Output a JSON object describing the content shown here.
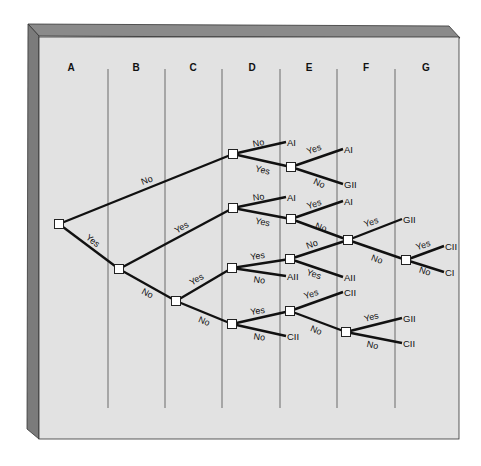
{
  "diagram": {
    "type": "decision-tree",
    "columns": [
      {
        "label": "A",
        "x": 71
      },
      {
        "label": "B",
        "x": 136
      },
      {
        "label": "C",
        "x": 193
      },
      {
        "label": "D",
        "x": 252
      },
      {
        "label": "E",
        "x": 309
      },
      {
        "label": "F",
        "x": 366
      },
      {
        "label": "G",
        "x": 426
      }
    ],
    "dividers_x": [
      108,
      165,
      222,
      280,
      337,
      395
    ],
    "colors": {
      "panel_face": "#e2e2e2",
      "panel_edge_top": "#8a8a8a",
      "panel_edge_left": "#7b7b7b",
      "lines": "#111111",
      "dividers": "#6a6a6a",
      "node_fill": "#ffffff"
    },
    "nodes": [
      {
        "id": "A",
        "x": 59,
        "y": 224
      },
      {
        "id": "B",
        "x": 119,
        "y": 269
      },
      {
        "id": "C",
        "x": 176,
        "y": 301
      },
      {
        "id": "D1",
        "x": 233,
        "y": 154
      },
      {
        "id": "D2",
        "x": 233,
        "y": 208
      },
      {
        "id": "D3",
        "x": 232,
        "y": 268
      },
      {
        "id": "D4",
        "x": 232,
        "y": 324
      },
      {
        "id": "E1",
        "x": 291,
        "y": 167
      },
      {
        "id": "E2",
        "x": 291,
        "y": 219
      },
      {
        "id": "E3",
        "x": 290,
        "y": 259
      },
      {
        "id": "E4",
        "x": 290,
        "y": 311
      },
      {
        "id": "F1",
        "x": 348,
        "y": 240
      },
      {
        "id": "F2",
        "x": 346,
        "y": 332
      },
      {
        "id": "G1",
        "x": 406,
        "y": 260
      }
    ],
    "edges": [
      {
        "from": "A",
        "to": "D1",
        "label": "No",
        "lx": 148,
        "ly": 183,
        "rot": -21
      },
      {
        "from": "A",
        "to": "B",
        "label": "Yes",
        "lx": 91,
        "ly": 243,
        "rot": 38
      },
      {
        "from": "B",
        "to": "D2",
        "label": "Yes",
        "lx": 183,
        "ly": 230,
        "rot": -30
      },
      {
        "from": "B",
        "to": "C",
        "label": "No",
        "lx": 146,
        "ly": 296,
        "rot": 28
      },
      {
        "from": "C",
        "to": "D3",
        "label": "Yes",
        "lx": 198,
        "ly": 282,
        "rot": -30
      },
      {
        "from": "C",
        "to": "D4",
        "label": "No",
        "lx": 203,
        "ly": 324,
        "rot": 22
      },
      {
        "from": "D1",
        "to": "E1",
        "label": "Yes",
        "lx": 262,
        "ly": 173,
        "rot": 13
      },
      {
        "from": "D2",
        "to": "E2",
        "label": "Yes",
        "lx": 262,
        "ly": 225,
        "rot": 12
      },
      {
        "from": "E2",
        "to": "F1",
        "label": "No",
        "lx": 320,
        "ly": 230,
        "rot": 20
      },
      {
        "from": "D3",
        "to": "E3",
        "label": "Yes",
        "lx": 258,
        "ly": 259,
        "rot": -8
      },
      {
        "from": "E3",
        "to": "F1",
        "label": "No",
        "lx": 313,
        "ly": 247,
        "rot": -20
      },
      {
        "from": "D4",
        "to": "E4",
        "label": "Yes",
        "lx": 258,
        "ly": 314,
        "rot": -8
      },
      {
        "from": "E4",
        "to": "F2",
        "label": "No",
        "lx": 315,
        "ly": 333,
        "rot": 22
      },
      {
        "from": "F1",
        "to": "G1",
        "label": "No",
        "lx": 376,
        "ly": 262,
        "rot": 20
      }
    ],
    "leaves": [
      {
        "from": "D1",
        "x": 286,
        "y": 142,
        "text": "AI",
        "label": "No",
        "lx": 259,
        "ly": 146,
        "rot": -10
      },
      {
        "from": "E1",
        "x": 343,
        "y": 149,
        "text": "AI",
        "label": "Yes",
        "lx": 315,
        "ly": 152,
        "rot": -20
      },
      {
        "from": "E1",
        "x": 343,
        "y": 184,
        "text": "GII",
        "label": "No",
        "lx": 318,
        "ly": 186,
        "rot": 25
      },
      {
        "from": "D2",
        "x": 286,
        "y": 197,
        "text": "AI",
        "label": "No",
        "lx": 259,
        "ly": 200,
        "rot": -8
      },
      {
        "from": "E2",
        "x": 343,
        "y": 201,
        "text": "AI",
        "label": "Yes",
        "lx": 315,
        "ly": 207,
        "rot": -18
      },
      {
        "from": "F1",
        "x": 402,
        "y": 219,
        "text": "GII",
        "label": "Yes",
        "lx": 372,
        "ly": 225,
        "rot": -18
      },
      {
        "from": "G1",
        "x": 444,
        "y": 246,
        "text": "CII",
        "label": "Yes",
        "lx": 424,
        "ly": 248,
        "rot": -18
      },
      {
        "from": "G1",
        "x": 444,
        "y": 272,
        "text": "CI",
        "label": "No",
        "lx": 424,
        "ly": 274,
        "rot": 18
      },
      {
        "from": "D3",
        "x": 286,
        "y": 276,
        "text": "AII",
        "label": "No",
        "lx": 259,
        "ly": 283,
        "rot": 8
      },
      {
        "from": "E3",
        "x": 343,
        "y": 277,
        "text": "AII",
        "label": "Yes",
        "lx": 313,
        "ly": 277,
        "rot": 18
      },
      {
        "from": "E4",
        "x": 343,
        "y": 292,
        "text": "CII",
        "label": "Yes",
        "lx": 312,
        "ly": 297,
        "rot": -18
      },
      {
        "from": "D4",
        "x": 286,
        "y": 336,
        "text": "CII",
        "label": "No",
        "lx": 259,
        "ly": 340,
        "rot": 8
      },
      {
        "from": "F2",
        "x": 402,
        "y": 318,
        "text": "GII",
        "label": "Yes",
        "lx": 372,
        "ly": 320,
        "rot": -15
      },
      {
        "from": "F2",
        "x": 402,
        "y": 343,
        "text": "CII",
        "label": "No",
        "lx": 372,
        "ly": 348,
        "rot": 12
      }
    ]
  }
}
